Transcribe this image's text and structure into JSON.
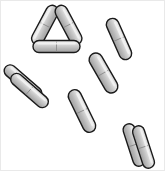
{
  "figure": {
    "canvas": {
      "width": 165,
      "height": 171
    },
    "background_color": "#ffffff",
    "frame_color": "#e9e9e9",
    "rod_style": {
      "outline_color": "#1a1a1a",
      "outline_width": 1.4,
      "fill_light": "#e6e6e6",
      "fill_mid": "#c8c8c8",
      "fill_dark": "#9a9a9a",
      "highlight_color": "#f2f2f2",
      "septum_color": "#8c8c8c"
    },
    "counts": {
      "clusters": 4,
      "rods_total": 10
    }
  },
  "chart_data": {
    "type": "scatter",
    "xlabel": "",
    "ylabel": "",
    "xlim": [
      0,
      165
    ],
    "ylim": [
      0,
      171
    ],
    "grid": false,
    "legend": "none",
    "units": "pixels",
    "clusters": [
      {
        "name": "triangle-cluster",
        "label": "Triangle formation",
        "rod_count": 3,
        "center": [
          56,
          28
        ],
        "rods": [
          {
            "id": "triangle-rod-left",
            "cx": 45.0,
            "cy": 25.0,
            "length": 43,
            "width": 12.5,
            "angle": -62,
            "septum": 0.5
          },
          {
            "id": "triangle-rod-right",
            "cx": 68.5,
            "cy": 25.0,
            "length": 43,
            "width": 12.5,
            "angle": 62,
            "septum": 0.5
          },
          {
            "id": "triangle-rod-bottom",
            "cx": 56.5,
            "cy": 46.5,
            "length": 47,
            "width": 12.0,
            "angle": 0,
            "septum": 0.5
          }
        ]
      },
      {
        "name": "left-pair-cluster",
        "label": "Left parallel pair",
        "rod_count": 2,
        "center": [
          26,
          86
        ],
        "rods": [
          {
            "id": "left-pair-rod-upper",
            "cx": 23.0,
            "cy": 82.0,
            "length": 46,
            "width": 12.0,
            "angle": 41,
            "septum": 0.5
          },
          {
            "id": "left-pair-rod-lower",
            "cx": 29.5,
            "cy": 90.5,
            "length": 46,
            "width": 12.0,
            "angle": 41,
            "septum": 0.5
          }
        ]
      },
      {
        "name": "chain-cluster",
        "label": "Bent chain of three",
        "rod_count": 3,
        "center": [
          99,
          77
        ],
        "rods": [
          {
            "id": "chain-rod-top",
            "cx": 119.0,
            "cy": 39.0,
            "length": 44,
            "width": 12.5,
            "angle": 66,
            "septum": 0.5
          },
          {
            "id": "chain-rod-middle",
            "cx": 103.5,
            "cy": 73.0,
            "length": 44,
            "width": 13.5,
            "angle": 60,
            "septum": 0.5
          },
          {
            "id": "chain-rod-bottom",
            "cx": 82.0,
            "cy": 111.0,
            "length": 46,
            "width": 13.0,
            "angle": 64,
            "septum": 0.5
          }
        ]
      },
      {
        "name": "right-pair-cluster",
        "label": "Lower-right parallel pair",
        "rod_count": 2,
        "center": [
          138,
          145
        ],
        "rods": [
          {
            "id": "right-pair-rod-left",
            "cx": 134.0,
            "cy": 145.0,
            "length": 44,
            "width": 12.0,
            "angle": 72,
            "septum": 0.5
          },
          {
            "id": "right-pair-rod-right",
            "cx": 143.5,
            "cy": 147.0,
            "length": 44,
            "width": 12.0,
            "angle": 72,
            "septum": 0.5
          }
        ]
      }
    ]
  }
}
